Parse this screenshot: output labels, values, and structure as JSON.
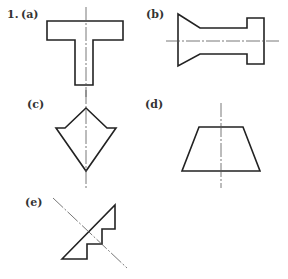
{
  "problem_number": "1.",
  "figures": [
    {
      "label": "(a)",
      "shape": "T-section"
    },
    {
      "label": "(b)",
      "shape": "flanged tapered section"
    },
    {
      "label": "(c)",
      "shape": "arrow-diamond section"
    },
    {
      "label": "(d)",
      "shape": "trapezoid"
    },
    {
      "label": "(e)",
      "shape": "stepped triangle with diagonal axis"
    }
  ],
  "colors": {
    "outline": "#222222",
    "centerline": "#555555"
  }
}
